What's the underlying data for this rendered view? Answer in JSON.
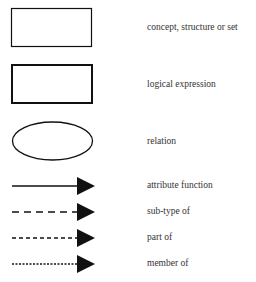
{
  "legend": {
    "items": [
      {
        "symbol": "thin-rectangle",
        "label": "concept, structure or set"
      },
      {
        "symbol": "thick-rectangle",
        "label": "logical expression"
      },
      {
        "symbol": "ellipse",
        "label": "relation"
      },
      {
        "symbol": "solid-arrow",
        "label": "attribute function"
      },
      {
        "symbol": "long-dashed-arrow",
        "label": "sub-type of"
      },
      {
        "symbol": "short-dashed-arrow",
        "label": "part of"
      },
      {
        "symbol": "dotted-arrow",
        "label": "member of"
      }
    ]
  }
}
